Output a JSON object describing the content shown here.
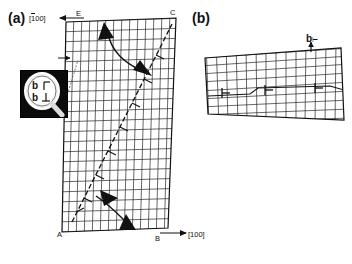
{
  "figure": {
    "type": "crystal-lattice-dislocation-diagram",
    "panels": [
      {
        "id": "a",
        "label": "(a)",
        "direction_label": "[100]",
        "direction_label_overbar_index": 0,
        "corner_labels": [
          "E",
          "C",
          "A",
          "B"
        ],
        "axis_arrow_label": "[100]",
        "annotations": [
          {
            "name": "burgers-top",
            "text": "b=1/2⟨0⟩"
          },
          {
            "name": "burgers-bottom",
            "text": "b=1/2⟨0⟩"
          }
        ],
        "inset": {
          "name": "magnifier-inset",
          "labels": [
            "b",
            "b"
          ],
          "symbol": "⊥"
        }
      },
      {
        "id": "b",
        "label": "(b)",
        "vector_label": "b",
        "dislocation_symbol": "⊢",
        "dislocation_count": 3
      }
    ],
    "colors": {
      "ink": "#111111",
      "grid": "#222222",
      "inset_bg": "#0b0b0b",
      "paper": "#ffffff"
    }
  }
}
